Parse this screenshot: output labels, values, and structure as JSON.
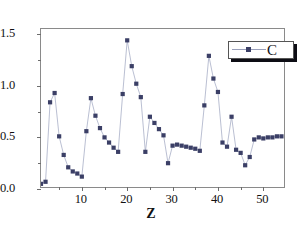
{
  "chart_data": {
    "type": "scatter",
    "title": "",
    "subtitle": "",
    "xlabel": "Z",
    "ylabel": "",
    "xlim": [
      1,
      55
    ],
    "ylim": [
      0.0,
      1.55
    ],
    "grid": false,
    "legend_position": "top-right",
    "legend": [
      "C"
    ],
    "xticks": [
      10,
      20,
      30,
      40,
      50
    ],
    "xtick_labels": [
      "10",
      "20",
      "30",
      "40",
      "50"
    ],
    "xminor_ticks": [
      5,
      15,
      25,
      35,
      45
    ],
    "yticks": [
      0.0,
      0.5,
      1.0,
      1.5
    ],
    "ytick_labels": [
      "0.0",
      "0.5",
      "1.0",
      "1.5"
    ],
    "yminor_ticks": [
      0.25,
      0.75,
      1.25
    ],
    "marker": "square",
    "marker_color": "#3b3f66",
    "line_color": "#a8aec6",
    "series": [
      {
        "name": "C",
        "x": [
          1,
          2,
          3,
          4,
          5,
          6,
          7,
          8,
          9,
          10,
          11,
          12,
          13,
          14,
          15,
          16,
          17,
          18,
          19,
          20,
          21,
          22,
          23,
          24,
          25,
          26,
          27,
          28,
          29,
          30,
          31,
          32,
          33,
          34,
          35,
          36,
          37,
          38,
          39,
          40,
          41,
          42,
          43,
          44,
          45,
          46,
          47,
          48,
          49,
          50,
          51,
          52,
          53,
          54
        ],
        "y": [
          0.05,
          0.07,
          0.84,
          0.93,
          0.51,
          0.33,
          0.21,
          0.17,
          0.15,
          0.12,
          0.56,
          0.88,
          0.71,
          0.59,
          0.5,
          0.45,
          0.4,
          0.36,
          0.92,
          1.44,
          1.19,
          1.02,
          0.89,
          0.36,
          0.7,
          0.64,
          0.58,
          0.52,
          0.25,
          0.42,
          0.43,
          0.42,
          0.41,
          0.4,
          0.39,
          0.37,
          0.81,
          1.29,
          1.07,
          0.94,
          0.45,
          0.41,
          0.7,
          0.38,
          0.35,
          0.23,
          0.31,
          0.48,
          0.5,
          0.49,
          0.5,
          0.5,
          0.51,
          0.51
        ]
      }
    ]
  }
}
